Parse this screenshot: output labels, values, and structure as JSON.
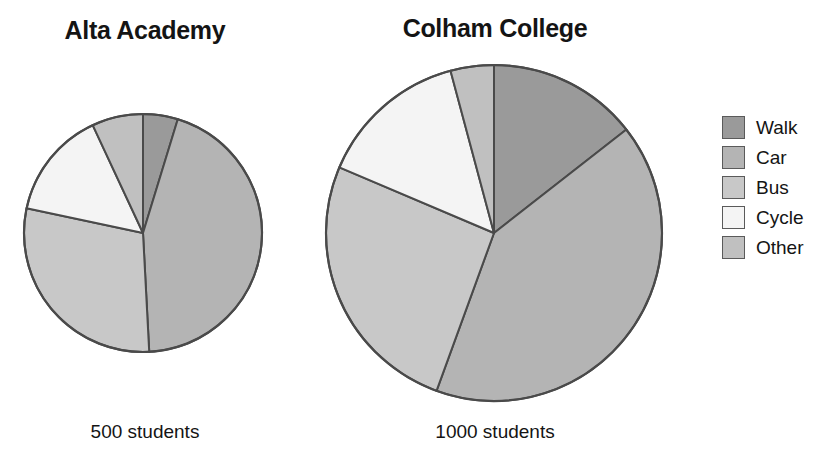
{
  "legend": {
    "title": "",
    "items": [
      {
        "label": "Walk",
        "color": "#9a9a9a"
      },
      {
        "label": "Car",
        "color": "#b4b4b4"
      },
      {
        "label": "Bus",
        "color": "#c8c8c8"
      },
      {
        "label": "Cycle",
        "color": "#f4f4f4"
      },
      {
        "label": "Other",
        "color": "#c0c0c0"
      }
    ]
  },
  "panels": [
    {
      "title": "Alta Academy",
      "caption": "500 students"
    },
    {
      "title": "Colham College",
      "caption": "1000 students"
    }
  ],
  "chart_data": {
    "type": "pie",
    "title": "",
    "legend_position": "right",
    "categories": [
      "Walk",
      "Car",
      "Bus",
      "Cycle",
      "Other"
    ],
    "colors": [
      "#9a9a9a",
      "#b4b4b4",
      "#c8c8c8",
      "#f4f4f4",
      "#c0c0c0"
    ],
    "stroke": "#4a4a4a",
    "units": "students",
    "start_angle_deg": 0,
    "direction": "clockwise",
    "charts": [
      {
        "name": "Alta Academy",
        "total_label": "500 students",
        "total": 500,
        "radius_px": 119,
        "center_px": [
          143,
          233
        ],
        "slices": [
          {
            "label": "Walk",
            "angle_deg": 17,
            "percent": 4.7,
            "value": 24
          },
          {
            "label": "Car",
            "angle_deg": 160,
            "percent": 44.4,
            "value": 222
          },
          {
            "label": "Bus",
            "angle_deg": 105,
            "percent": 29.2,
            "value": 146
          },
          {
            "label": "Cycle",
            "angle_deg": 53,
            "percent": 14.7,
            "value": 74
          },
          {
            "label": "Other",
            "angle_deg": 25,
            "percent": 6.9,
            "value": 35
          }
        ]
      },
      {
        "name": "Colham College",
        "total_label": "1000 students",
        "total": 1000,
        "radius_px": 168,
        "center_px": [
          494,
          233
        ],
        "slices": [
          {
            "label": "Walk",
            "angle_deg": 52,
            "percent": 14.4,
            "value": 144
          },
          {
            "label": "Car",
            "angle_deg": 148,
            "percent": 41.1,
            "value": 411
          },
          {
            "label": "Bus",
            "angle_deg": 93,
            "percent": 25.8,
            "value": 258
          },
          {
            "label": "Cycle",
            "angle_deg": 52,
            "percent": 14.4,
            "value": 144
          },
          {
            "label": "Other",
            "angle_deg": 15,
            "percent": 4.2,
            "value": 42
          }
        ]
      }
    ]
  }
}
